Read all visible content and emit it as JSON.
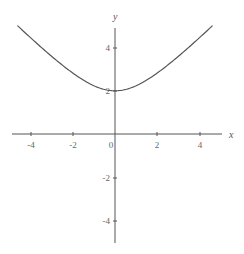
{
  "chart_data": {
    "type": "line",
    "title": "",
    "xlabel": "x",
    "ylabel": "y",
    "xlim": [
      -5.2,
      5.4
    ],
    "ylim": [
      -5.2,
      5.4
    ],
    "grid": false,
    "legend": null,
    "x_ticks": [
      -4,
      -2,
      0,
      2,
      4
    ],
    "y_ticks": [
      -4,
      -2,
      2,
      4
    ],
    "x_tick_labels": [
      "-4",
      "-2",
      "0",
      "2",
      "4"
    ],
    "y_tick_labels": [
      "-4",
      "-2",
      "2",
      "4"
    ],
    "series": [
      {
        "name": "y = sqrt(x^2 + 4)",
        "x": [
          -4.6,
          -4,
          -3,
          -2,
          -1,
          0,
          1,
          2,
          3,
          4,
          4.6
        ],
        "values": [
          5.02,
          4.47,
          3.61,
          2.83,
          2.24,
          2.0,
          2.24,
          2.83,
          3.61,
          4.47,
          5.02
        ]
      }
    ]
  },
  "labels": {
    "x_axis": "x",
    "y_axis": "y",
    "x_ticks": [
      "-4",
      "-2",
      "0",
      "2",
      "4"
    ],
    "y_ticks": [
      "4",
      "2",
      "-2",
      "-4"
    ]
  }
}
